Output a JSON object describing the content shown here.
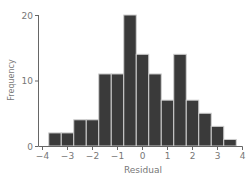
{
  "chart_data": {
    "type": "bar",
    "title": "",
    "xlabel": "Residual",
    "ylabel": "Frequency",
    "bin_width": 0.5,
    "categories": [
      -3.5,
      -3.0,
      -2.5,
      -2.0,
      -1.5,
      -1.0,
      -0.5,
      0.0,
      0.5,
      1.0,
      1.5,
      2.0,
      2.5,
      3.0,
      3.5
    ],
    "values": [
      2,
      2,
      4,
      4,
      11,
      11,
      20,
      14,
      11,
      7,
      14,
      7,
      5,
      3,
      1
    ],
    "xlim": [
      -4,
      4
    ],
    "ylim": [
      0,
      20
    ],
    "xticks": [
      -4,
      -3,
      -2,
      -1,
      0,
      1,
      2,
      3,
      4
    ],
    "yticks": [
      0,
      10,
      20
    ],
    "grid": false,
    "legend": null,
    "bar_color": "#3a3a3a",
    "bar_edge_color": "#cfcfcf",
    "axis_color": "#666666"
  }
}
